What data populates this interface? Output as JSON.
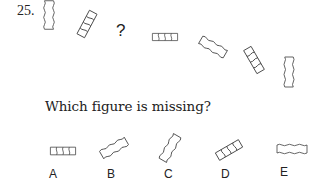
{
  "question": {
    "number": "25.",
    "missing_marker": "?",
    "prompt": "Which figure is missing?"
  },
  "sequence": [
    {
      "position": 1,
      "shape": "wavy-side-rectangle",
      "orientation_deg": 90,
      "divisions": 0
    },
    {
      "position": 2,
      "shape": "segmented-rectangle",
      "orientation_deg": 60,
      "divisions": 4
    },
    {
      "position": 3,
      "shape": "missing",
      "label": "?"
    },
    {
      "position": 4,
      "shape": "segmented-rectangle",
      "orientation_deg": 0,
      "divisions": 4
    },
    {
      "position": 5,
      "shape": "wavy-side-rectangle",
      "orientation_deg": -30,
      "divisions": 0
    },
    {
      "position": 6,
      "shape": "segmented-rectangle",
      "orientation_deg": -60,
      "divisions": 4
    },
    {
      "position": 7,
      "shape": "wavy-side-rectangle",
      "orientation_deg": 90,
      "divisions": 0
    }
  ],
  "options": [
    {
      "label": "A",
      "shape": "segmented-rectangle",
      "orientation_deg": 0
    },
    {
      "label": "B",
      "shape": "wavy-side-rectangle",
      "orientation_deg": 30
    },
    {
      "label": "C",
      "shape": "wavy-side-rectangle",
      "orientation_deg": 60
    },
    {
      "label": "D",
      "shape": "segmented-rectangle",
      "orientation_deg": 30
    },
    {
      "label": "E",
      "shape": "wavy-side-rectangle",
      "orientation_deg": 0
    }
  ],
  "colors": {
    "stroke": "#444444",
    "text": "#222222",
    "background": "#ffffff"
  }
}
